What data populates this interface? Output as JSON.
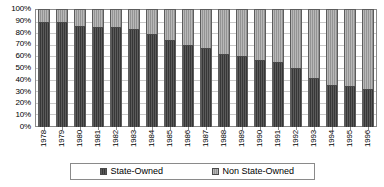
{
  "chart_data": {
    "type": "bar",
    "title": "",
    "subtitle": "",
    "xlabel": "",
    "ylabel": "",
    "stacked": true,
    "stacked_mode": "percent",
    "grid": true,
    "legend_position": "bottom",
    "ylim": [
      0,
      100
    ],
    "y_ticks": [
      "0%",
      "10%",
      "20%",
      "30%",
      "40%",
      "50%",
      "60%",
      "70%",
      "80%",
      "90%",
      "100%"
    ],
    "y_tick_values": [
      0,
      10,
      20,
      30,
      40,
      50,
      60,
      70,
      80,
      90,
      100
    ],
    "categories": [
      "1978",
      "1979",
      "1980",
      "1981",
      "1982",
      "1983",
      "1984",
      "1985",
      "1986",
      "1987",
      "1988",
      "1989",
      "1990",
      "1991",
      "1992",
      "1993",
      "1994",
      "1995",
      "1996"
    ],
    "series": [
      {
        "name": "State-Owned",
        "color": "#434343",
        "values": [
          88,
          88,
          85,
          84,
          84,
          82,
          78,
          73,
          69,
          66,
          61,
          59,
          56,
          54,
          49,
          41,
          35,
          34,
          31
        ]
      },
      {
        "name": "Non State-Owned",
        "color": "#9a9a9a",
        "values": [
          12,
          12,
          15,
          16,
          16,
          18,
          22,
          27,
          31,
          34,
          39,
          41,
          44,
          46,
          51,
          59,
          65,
          66,
          69
        ]
      }
    ]
  },
  "legend": {
    "entries": [
      {
        "label": "State-Owned",
        "swatch": "dark"
      },
      {
        "label": "Non State-Owned",
        "swatch": "light"
      }
    ]
  }
}
